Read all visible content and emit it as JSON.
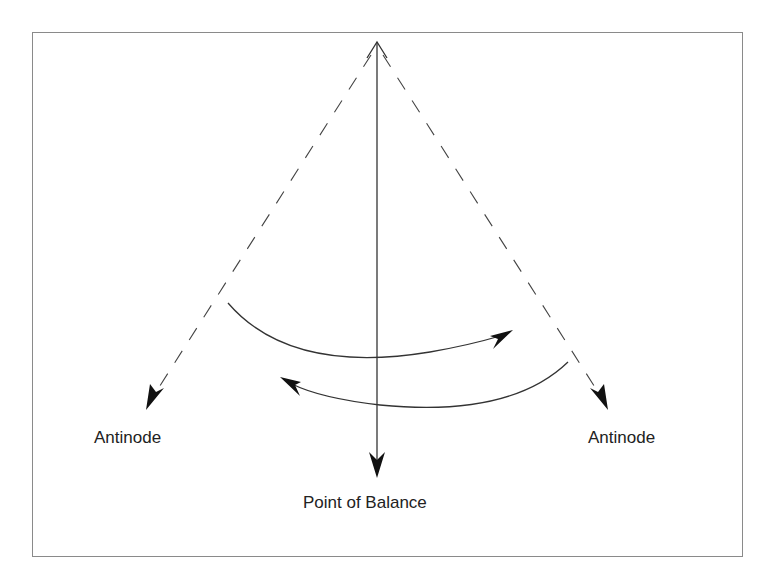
{
  "diagram": {
    "type": "pendulum-oscillation",
    "labels": {
      "left": "Antinode",
      "right": "Antinode",
      "bottom": "Point of Balance"
    },
    "colors": {
      "line": "#333333",
      "arrowhead": "#111111",
      "frame": "#8a8a8a",
      "text": "#222222"
    },
    "elements": [
      {
        "id": "center-axis",
        "style": "solid",
        "from": "apex",
        "to": "Point of Balance",
        "arrows": "both"
      },
      {
        "id": "left-swing-limit",
        "style": "dashed",
        "from": "apex",
        "to": "left Antinode",
        "arrows": "end"
      },
      {
        "id": "right-swing-limit",
        "style": "dashed",
        "from": "apex",
        "to": "right Antinode",
        "arrows": "end"
      },
      {
        "id": "arc-left-to-right",
        "style": "solid",
        "direction": "left-to-right"
      },
      {
        "id": "arc-right-to-left",
        "style": "solid",
        "direction": "right-to-left"
      }
    ]
  }
}
